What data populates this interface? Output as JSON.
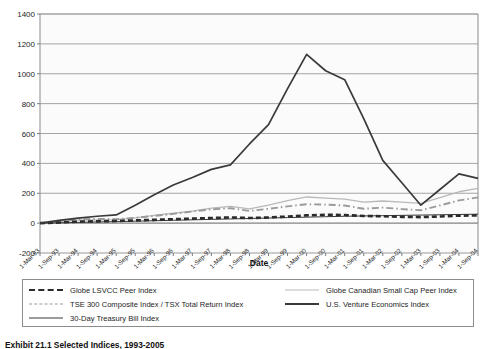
{
  "caption": "Exhibit 21.1  Selected Indices, 1993-2005",
  "legend": {
    "left_items": [
      {
        "label": "Globe LSVCC Peer Index",
        "style": "dash",
        "color": "#2b2b2b"
      },
      {
        "label": "TSE 300 Composite Index / TSX Total Return Index",
        "style": "dashdot",
        "color": "#9a9a9a"
      },
      {
        "label": "30-Day Treasury Bill Index",
        "style": "solid-thin",
        "color": "#3a3a3a"
      }
    ],
    "right_items": [
      {
        "label": "Globe Canadian Small Cap Peer Index",
        "style": "solid-light",
        "color": "#b9b9b9"
      },
      {
        "label": "U.S. Venture Economics Index",
        "style": "solid-dark",
        "color": "#3a3a3a"
      }
    ]
  },
  "chart_data": {
    "type": "line",
    "title": "",
    "xlabel": "Date",
    "ylabel": "",
    "ylim": [
      -200,
      1400
    ],
    "yticks": [
      -200,
      0,
      200,
      400,
      600,
      800,
      1000,
      1200,
      1400
    ],
    "grid": true,
    "legend_position": "bottom",
    "categories": [
      "1-Mar-93",
      "1-Sep-93",
      "1-Mar-94",
      "1-Sep-94",
      "1-Mar-95",
      "1-Sep-95",
      "1-Mar-96",
      "1-Sep-96",
      "1-Mar-97",
      "1-Sep-97",
      "1-Mar-98",
      "1-Sep-98",
      "1-Mar-99",
      "1-Sep-99",
      "1-Mar-00",
      "1-Sep-00",
      "1-Mar-01",
      "1-Sep-01",
      "1-Mar-02",
      "1-Sep-02",
      "1-Mar-03",
      "1-Sep-03",
      "1-Mar-04",
      "1-Sep-04"
    ],
    "series": [
      {
        "name": "U.S. Venture Economics Index",
        "style": "solid-dark",
        "color": "#3a3a3a",
        "values": [
          0,
          18,
          34,
          46,
          55,
          120,
          190,
          255,
          305,
          360,
          390,
          530,
          660,
          900,
          1130,
          1020,
          960,
          700,
          420,
          270,
          120,
          225,
          330,
          300
        ]
      },
      {
        "name": "Globe Canadian Small Cap Peer Index",
        "style": "solid-light",
        "color": "#b9b9b9",
        "values": [
          0,
          8,
          20,
          22,
          24,
          35,
          52,
          66,
          80,
          100,
          112,
          96,
          120,
          150,
          175,
          168,
          160,
          140,
          148,
          140,
          132,
          170,
          210,
          232
        ]
      },
      {
        "name": "TSE 300 Composite Index / TSX Total Return Index",
        "style": "dashdot",
        "color": "#9a9a9a",
        "values": [
          0,
          10,
          26,
          28,
          26,
          36,
          48,
          62,
          78,
          92,
          100,
          82,
          96,
          112,
          126,
          124,
          118,
          96,
          104,
          94,
          86,
          118,
          152,
          172
        ]
      },
      {
        "name": "Globe LSVCC Peer Index",
        "style": "dash",
        "color": "#2b2b2b",
        "values": [
          0,
          4,
          10,
          12,
          14,
          18,
          22,
          26,
          30,
          34,
          38,
          34,
          38,
          44,
          52,
          56,
          54,
          48,
          46,
          42,
          40,
          44,
          50,
          52
        ]
      },
      {
        "name": "30-Day Treasury Bill Index",
        "style": "solid-thin",
        "color": "#3a3a3a",
        "values": [
          0,
          2,
          5,
          8,
          10,
          13,
          16,
          19,
          22,
          25,
          28,
          31,
          34,
          37,
          40,
          43,
          46,
          48,
          50,
          52,
          54,
          56,
          58,
          60
        ]
      }
    ]
  }
}
